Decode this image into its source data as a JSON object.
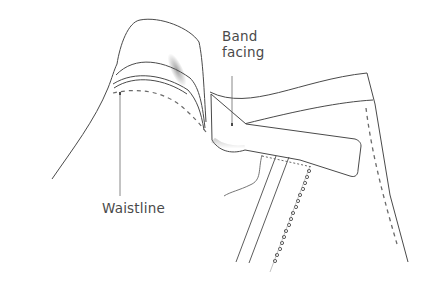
{
  "diagram": {
    "labels": {
      "band_facing_line1": "Band",
      "band_facing_line2": "facing",
      "waistline": "Waistline"
    },
    "colors": {
      "outline": "#4a4a4a",
      "stitching": "#6a6a6a",
      "shadow": "#9a9a9a",
      "label_text": "#4a4a4a",
      "background": "#ffffff"
    }
  }
}
